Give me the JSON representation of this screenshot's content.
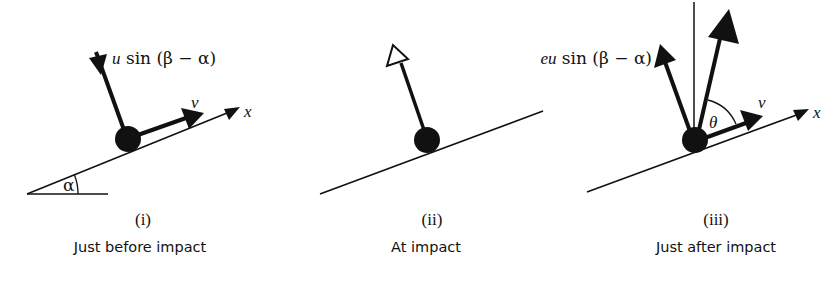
{
  "figure": {
    "ink_color": "#111111",
    "background": "#ffffff",
    "panels": [
      {
        "id": "i",
        "number_label": "(i)",
        "caption": "Just before impact",
        "velocity_normal_label": {
          "coef": "",
          "var": "u",
          "text": " sin (β − α)"
        },
        "velocity_tangent_label": "v",
        "axis_label": "x",
        "angle_label": "α"
      },
      {
        "id": "ii",
        "number_label": "(ii)",
        "caption": "At impact"
      },
      {
        "id": "iii",
        "number_label": "(iii)",
        "caption": "Just after impact",
        "velocity_normal_label": {
          "coef": "e",
          "var": "u",
          "text": " sin (β − α)"
        },
        "velocity_tangent_label": "v",
        "axis_label": "x",
        "angle_label": "θ"
      }
    ]
  }
}
